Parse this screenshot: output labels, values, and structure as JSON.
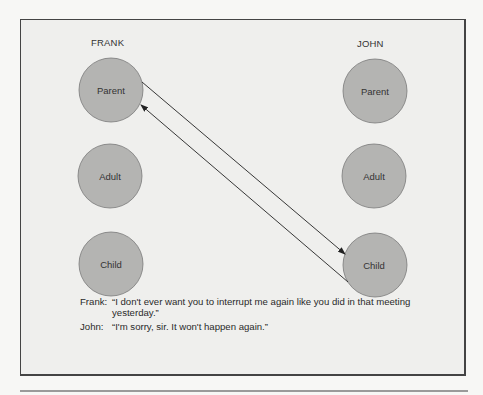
{
  "diagram": {
    "people": [
      {
        "name": "FRANK",
        "states": [
          "Parent",
          "Adult",
          "Child"
        ]
      },
      {
        "name": "JOHN",
        "states": [
          "Parent",
          "Adult",
          "Child"
        ]
      }
    ],
    "transactions": [
      {
        "from": "FRANK.Parent",
        "to": "JOHN.Child"
      },
      {
        "from": "JOHN.Child",
        "to": "FRANK.Parent"
      }
    ],
    "colors": {
      "circle_fill": "#b4b4b2",
      "circle_stroke": "#7a7a7a",
      "arrow": "#222222",
      "frame_bg": "#efefed"
    }
  },
  "dialogue": [
    {
      "speaker": "Frank:",
      "text": "“I don't ever want you to interrupt me again like you did in that meeting yesterday.”"
    },
    {
      "speaker": "John:",
      "text": "“I'm sorry, sir. It won't happen again.”"
    }
  ]
}
